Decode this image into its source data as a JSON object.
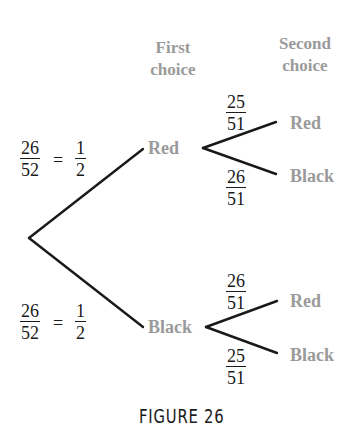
{
  "headers": {
    "first_choice": [
      "First",
      "choice"
    ],
    "second_choice": [
      "Second",
      "choice"
    ]
  },
  "root_branches": {
    "top": {
      "probability": {
        "numerator": "26",
        "denominator": "52"
      },
      "equals": "=",
      "simplified": {
        "numerator": "1",
        "denominator": "2"
      },
      "node_label": "Red"
    },
    "bottom": {
      "probability": {
        "numerator": "26",
        "denominator": "52"
      },
      "equals": "=",
      "simplified": {
        "numerator": "1",
        "denominator": "2"
      },
      "node_label": "Black"
    }
  },
  "second_level": {
    "after_red": [
      {
        "label": "Red",
        "probability": {
          "numerator": "25",
          "denominator": "51"
        }
      },
      {
        "label": "Black",
        "probability": {
          "numerator": "26",
          "denominator": "51"
        }
      }
    ],
    "after_black": [
      {
        "label": "Red",
        "probability": {
          "numerator": "26",
          "denominator": "51"
        }
      },
      {
        "label": "Black",
        "probability": {
          "numerator": "25",
          "denominator": "51"
        }
      }
    ]
  },
  "caption": "FIGURE 26",
  "colors": {
    "line": "#1a1a1a",
    "label_gray": "#9a9a9a",
    "text": "#1a1a1a",
    "background": "#ffffff"
  }
}
